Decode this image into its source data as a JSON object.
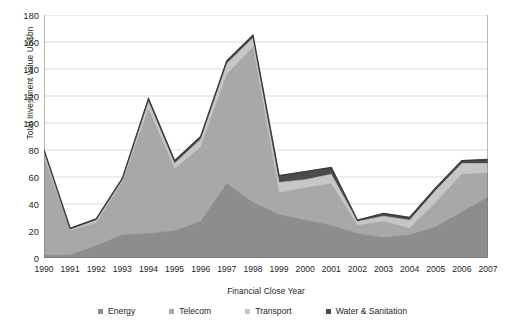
{
  "chart_data": {
    "type": "area",
    "stacked": true,
    "title": "",
    "xlabel": "Financial Close Year",
    "ylabel": "Total Investment value US$bn",
    "categories": [
      "1990",
      "1991",
      "1992",
      "1993",
      "1994",
      "1995",
      "1996",
      "1997",
      "1998",
      "1999",
      "2000",
      "2001",
      "2002",
      "2003",
      "2004",
      "2005",
      "2006",
      "2007"
    ],
    "x": [
      1990,
      1991,
      1992,
      1993,
      1994,
      1995,
      1996,
      1997,
      1998,
      1999,
      2000,
      2001,
      2002,
      2003,
      2004,
      2005,
      2006,
      2007
    ],
    "ylim": [
      0,
      180
    ],
    "yticks": [
      0,
      20,
      40,
      60,
      80,
      100,
      120,
      140,
      160,
      180
    ],
    "grid": true,
    "legend_position": "bottom",
    "series": [
      {
        "name": "Energy",
        "color": "#8d8d8d",
        "values": [
          2,
          2,
          9,
          17,
          18,
          20,
          27,
          55,
          41,
          32,
          28,
          24,
          18,
          15,
          17,
          23,
          34,
          45
        ]
      },
      {
        "name": "Telecom",
        "color": "#a8a8a8",
        "values": [
          74,
          20,
          26,
          56,
          110,
          66,
          82,
          136,
          156,
          48,
          52,
          55,
          24,
          27,
          22,
          41,
          62,
          63
        ]
      },
      {
        "name": "Transport",
        "color": "#c6c6c6",
        "values": [
          80,
          21,
          28,
          58,
          116,
          70,
          88,
          144,
          163,
          56,
          58,
          62,
          27,
          31,
          28,
          50,
          70,
          70
        ]
      },
      {
        "name": "Water & Sanitation",
        "color": "#4a4a4a",
        "values": [
          80,
          22,
          29,
          59,
          118,
          72,
          90,
          146,
          165,
          61,
          64,
          67,
          28,
          33,
          30,
          52,
          72,
          73
        ]
      }
    ],
    "totals": [
      80,
      22,
      29,
      59,
      118,
      72,
      90,
      146,
      165,
      61,
      64,
      67,
      28,
      33,
      30,
      52,
      72,
      73
    ]
  },
  "axis": {
    "ylabel": "Total Investment value US$bn",
    "xlabel": "Financial Close Year"
  }
}
